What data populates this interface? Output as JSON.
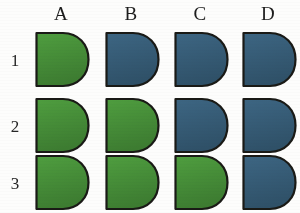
{
  "figure": {
    "background_color": "#fdfdfc",
    "columns": [
      {
        "id": "A",
        "label": "A",
        "x": 33
      },
      {
        "id": "B",
        "label": "B",
        "x": 103
      },
      {
        "id": "C",
        "label": "C",
        "x": 172
      },
      {
        "id": "D",
        "label": "D",
        "x": 240
      }
    ],
    "rows": [
      {
        "id": "1",
        "label": "1",
        "y": 30
      },
      {
        "id": "2",
        "label": "2",
        "y": 96
      },
      {
        "id": "3",
        "label": "3",
        "y": 153
      }
    ],
    "colors": {
      "green": "#4f9e3f",
      "green_dark": "#3d7c31",
      "blue": "#3d6683",
      "blue_dark": "#2f5168",
      "outline": "#1a1a16",
      "text": "#1d1d1d"
    },
    "shape": {
      "name": "d-shape",
      "description": "flat vertical left edge with bulging rounded right side"
    },
    "cells": [
      {
        "row": "1",
        "column": "A",
        "fill": "green",
        "name": "shape-1-A"
      },
      {
        "row": "1",
        "column": "B",
        "fill": "blue",
        "name": "shape-1-B"
      },
      {
        "row": "1",
        "column": "C",
        "fill": "blue",
        "name": "shape-1-C"
      },
      {
        "row": "1",
        "column": "D",
        "fill": "blue",
        "name": "shape-1-D"
      },
      {
        "row": "2",
        "column": "A",
        "fill": "green",
        "name": "shape-2-A"
      },
      {
        "row": "2",
        "column": "B",
        "fill": "green",
        "name": "shape-2-B"
      },
      {
        "row": "2",
        "column": "C",
        "fill": "blue",
        "name": "shape-2-C"
      },
      {
        "row": "2",
        "column": "D",
        "fill": "blue",
        "name": "shape-2-D"
      },
      {
        "row": "3",
        "column": "A",
        "fill": "green",
        "name": "shape-3-A"
      },
      {
        "row": "3",
        "column": "B",
        "fill": "green",
        "name": "shape-3-B"
      },
      {
        "row": "3",
        "column": "C",
        "fill": "green",
        "name": "shape-3-C"
      },
      {
        "row": "3",
        "column": "D",
        "fill": "blue",
        "name": "shape-3-D"
      }
    ]
  }
}
